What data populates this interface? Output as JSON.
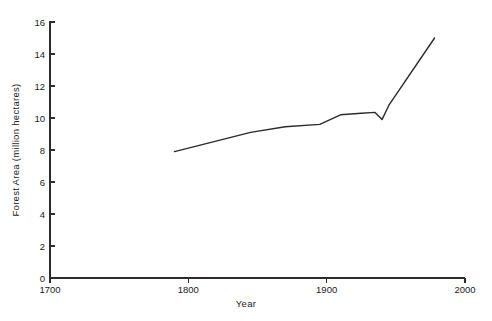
{
  "chart_data": {
    "type": "line",
    "title": "",
    "subtitle": "",
    "xlabel": "Year",
    "ylabel": "Forest Area (million hectares)",
    "xlim": [
      1700,
      2000
    ],
    "ylim": [
      0,
      16
    ],
    "xticks": [
      1700,
      1800,
      1900,
      2000
    ],
    "xtick_labels": [
      "1700",
      "1800",
      "1900",
      "2000"
    ],
    "yticks": [
      0,
      2,
      4,
      6,
      8,
      10,
      12,
      14,
      16
    ],
    "ytick_labels": [
      "0",
      "2",
      "4",
      "6",
      "8",
      "10",
      "12",
      "14",
      "16"
    ],
    "grid": false,
    "legend": false,
    "legend_position": "none",
    "line_color": "#2b2b2b",
    "line_width": 1.4,
    "series": [
      {
        "name": "Forest Area",
        "x": [
          1790,
          1845,
          1870,
          1895,
          1910,
          1925,
          1935,
          1940,
          1945,
          1978
        ],
        "values": [
          7.9,
          9.1,
          9.45,
          9.6,
          10.2,
          10.3,
          10.35,
          9.9,
          10.8,
          15.0
        ]
      }
    ],
    "annotations": []
  },
  "axes": {
    "y_title": "Forest Area (million hectares)",
    "x_title": "Year"
  }
}
